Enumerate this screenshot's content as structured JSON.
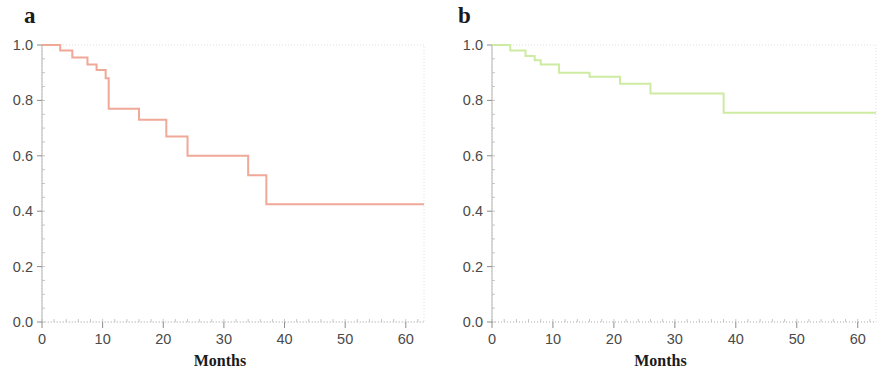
{
  "figure": {
    "panels": [
      {
        "id": "a",
        "label": "a",
        "xlabel": "Months",
        "ylabel": "",
        "line_color": "#f0a898",
        "y_ticks": [
          "0.0",
          "0.2",
          "0.4",
          "0.6",
          "0.8",
          "1.0"
        ],
        "x_ticks": [
          "0",
          "10",
          "20",
          "30",
          "40",
          "50",
          "60"
        ]
      },
      {
        "id": "b",
        "label": "b",
        "xlabel": "Months",
        "ylabel": "",
        "line_color": "#cdeba1",
        "y_ticks": [
          "0.0",
          "0.2",
          "0.4",
          "0.6",
          "0.8",
          "1.0"
        ],
        "x_ticks": [
          "0",
          "10",
          "20",
          "30",
          "40",
          "50",
          "60"
        ]
      }
    ]
  },
  "chart_data": [
    {
      "type": "line",
      "subtype": "kaplan-meier-step",
      "panel": "a",
      "title": "a",
      "xlabel": "Months",
      "ylabel": "",
      "xlim": [
        0,
        63
      ],
      "ylim": [
        0.0,
        1.0
      ],
      "xticks": [
        0,
        10,
        20,
        30,
        40,
        50,
        60
      ],
      "yticks": [
        0.0,
        0.2,
        0.4,
        0.6,
        0.8,
        1.0
      ],
      "grid": false,
      "legend": null,
      "color": "#f0a898",
      "series": [
        {
          "name": "Survival probability (a)",
          "x": [
            0,
            3,
            5,
            7.5,
            9,
            10.5,
            11,
            16,
            20.5,
            24,
            34,
            37,
            63
          ],
          "y": [
            1.0,
            0.98,
            0.955,
            0.93,
            0.91,
            0.88,
            0.77,
            0.73,
            0.67,
            0.6,
            0.53,
            0.425,
            0.425
          ]
        }
      ]
    },
    {
      "type": "line",
      "subtype": "kaplan-meier-step",
      "panel": "b",
      "title": "b",
      "xlabel": "Months",
      "ylabel": "",
      "xlim": [
        0,
        63
      ],
      "ylim": [
        0.0,
        1.0
      ],
      "xticks": [
        0,
        10,
        20,
        30,
        40,
        50,
        60
      ],
      "yticks": [
        0.0,
        0.2,
        0.4,
        0.6,
        0.8,
        1.0
      ],
      "grid": false,
      "legend": null,
      "color": "#cdeba1",
      "series": [
        {
          "name": "Survival probability (b)",
          "x": [
            0,
            3,
            5.5,
            7,
            8,
            11,
            16,
            21,
            26,
            38,
            63
          ],
          "y": [
            1.0,
            0.98,
            0.96,
            0.945,
            0.93,
            0.9,
            0.885,
            0.86,
            0.825,
            0.755,
            0.755
          ]
        }
      ]
    }
  ]
}
